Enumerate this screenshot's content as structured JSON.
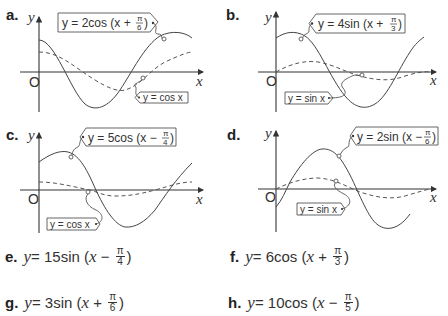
{
  "graphs": [
    {
      "label": "a.",
      "main_eq": {
        "prefix": "y = 2cos (x + ",
        "num": "π",
        "den": "6",
        "suffix": ")"
      },
      "ref_eq": "y = cos x",
      "axis_x": "x",
      "axis_y": "y",
      "origin": "O"
    },
    {
      "label": "b.",
      "main_eq": {
        "prefix": "y = 4sin (x + ",
        "num": "π",
        "den": "3",
        "suffix": ")"
      },
      "ref_eq": "y = sin x",
      "axis_x": "x",
      "axis_y": "y",
      "origin": "O"
    },
    {
      "label": "c.",
      "main_eq": {
        "prefix": "y = 5cos (x − ",
        "num": "π",
        "den": "4",
        "suffix": ")"
      },
      "ref_eq": "y = cos x",
      "axis_x": "x",
      "axis_y": "y",
      "origin": "O"
    },
    {
      "label": "d.",
      "main_eq": {
        "prefix": "y = 2sin (x − ",
        "num": "π",
        "den": "6",
        "suffix": ")"
      },
      "ref_eq": "y = sin x",
      "axis_x": "x",
      "axis_y": "y",
      "origin": "O"
    }
  ],
  "exercises": [
    {
      "label": "e.",
      "y": "y",
      "rest": " = 15sin (",
      "x": "x",
      "op": " − ",
      "num": "π",
      "den": "4",
      "close": ")"
    },
    {
      "label": "f.",
      "y": "y",
      "rest": " = 6cos (",
      "x": "x",
      "op": " + ",
      "num": "π",
      "den": "3",
      "close": ")"
    },
    {
      "label": "g.",
      "y": "y",
      "rest": " = 3sin (",
      "x": "x",
      "op": " + ",
      "num": "π",
      "den": "6",
      "close": ")"
    },
    {
      "label": "h.",
      "y": "y",
      "rest": " = 10cos (",
      "x": "x",
      "op": " − ",
      "num": "π",
      "den": "5",
      "close": ")"
    }
  ]
}
